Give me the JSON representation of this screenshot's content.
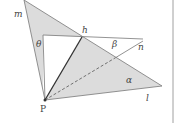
{
  "diagram": {
    "labels": {
      "m": "m",
      "h": "h",
      "theta": "θ",
      "beta": "β",
      "n": "n",
      "alpha": "α",
      "l": "l",
      "P": "P"
    },
    "colors": {
      "fill": "#dcdcdc",
      "stroke": "#666666",
      "dark_stroke": "#333333"
    }
  }
}
